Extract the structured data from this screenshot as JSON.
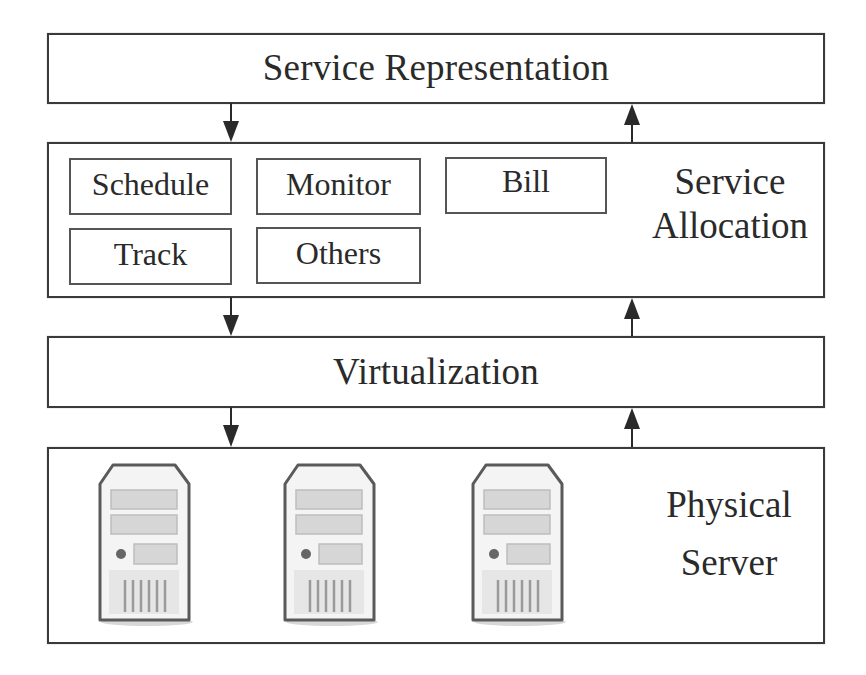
{
  "diagram": {
    "layers": {
      "service_representation": {
        "title": "Service Representation"
      },
      "service_allocation": {
        "title_line1": "Service",
        "title_line2": "Allocation",
        "modules": [
          {
            "label": "Schedule"
          },
          {
            "label": "Monitor"
          },
          {
            "label": "Bill"
          },
          {
            "label": "Track"
          },
          {
            "label": "Others"
          }
        ]
      },
      "virtualization": {
        "title": "Virtualization"
      },
      "physical_server": {
        "title_line1": "Physical",
        "title_line2": "Server",
        "server_count": 3,
        "servers": [
          {
            "icon": "server-tower-icon"
          },
          {
            "icon": "server-tower-icon"
          },
          {
            "icon": "server-tower-icon"
          }
        ]
      }
    },
    "arrows": [
      {
        "from": "Service Representation",
        "to": "Service Allocation",
        "direction": "down"
      },
      {
        "from": "Service Allocation",
        "to": "Service Representation",
        "direction": "up"
      },
      {
        "from": "Service Allocation",
        "to": "Virtualization",
        "direction": "down"
      },
      {
        "from": "Virtualization",
        "to": "Service Allocation",
        "direction": "up"
      },
      {
        "from": "Virtualization",
        "to": "Physical Server",
        "direction": "down"
      },
      {
        "from": "Physical Server",
        "to": "Virtualization",
        "direction": "up"
      }
    ],
    "colors": {
      "stroke": "#3a3a3a",
      "text": "#2a2a2a",
      "server_fill": "#e8e8e8",
      "server_outline": "#555555"
    }
  }
}
